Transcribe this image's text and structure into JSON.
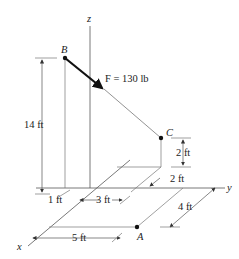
{
  "diagram": {
    "axes": {
      "x": "x",
      "y": "y",
      "z": "z"
    },
    "points": {
      "A": "A",
      "B": "B",
      "C": "C"
    },
    "force": {
      "label": "F = 130 lb"
    },
    "dimensions": {
      "height_B": "14 ft",
      "dx_B": "1 ft",
      "dy_B": "3 ft",
      "height_C": "2 ft",
      "dx_C": "2 ft",
      "dx_A": "4 ft",
      "dy_A": "5 ft"
    }
  }
}
